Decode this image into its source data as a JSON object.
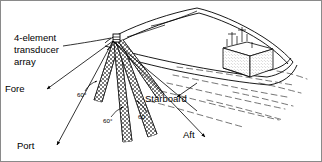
{
  "figure": {
    "title_label": "4-element transducer array sonar beam geometry",
    "annotations": {
      "array_label_line1": "4-element",
      "array_label_line2": "transducer",
      "array_label_line3": "array",
      "fore": "Fore",
      "port": "Port",
      "starboard": "Starboard",
      "aft": "Aft"
    },
    "angles": [
      {
        "id": "angle-port-fore",
        "value": "60°"
      },
      {
        "id": "angle-center",
        "value": "60°"
      },
      {
        "id": "angle-starboard",
        "value": "60"
      }
    ],
    "colors": {
      "ink": "#000000",
      "paper": "#ffffff",
      "wake": "#3a3a3a",
      "border": "#8a8a8a"
    },
    "elements": {
      "ship_hull": "ship-hull",
      "deckhouse": "deckhouse",
      "masts": "masts",
      "wake": "wake-lines",
      "beams": "transducer-beams",
      "axes": "direction-axes"
    }
  }
}
